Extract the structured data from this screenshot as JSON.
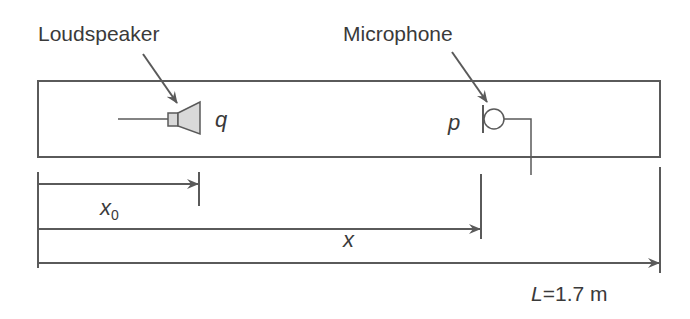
{
  "labels": {
    "loudspeaker": "Loudspeaker",
    "microphone": "Microphone",
    "source_symbol": "q",
    "pressure_symbol": "p",
    "x0_main": "x",
    "x0_sub": "0",
    "x_label": "x",
    "length_var": "L",
    "length_value": "=1.7 m"
  },
  "colors": {
    "stroke": "#5a5a5a",
    "text": "#3a3a3a",
    "speaker_fill": "#d9d9d9",
    "background": "#ffffff"
  }
}
